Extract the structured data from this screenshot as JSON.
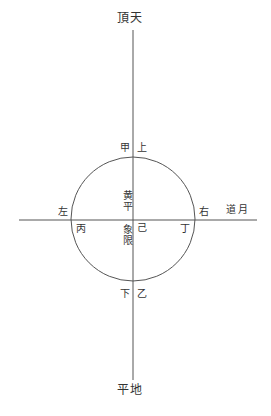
{
  "diagram": {
    "title_top": "頂天",
    "title_bottom": "平地",
    "label_left": "左",
    "label_right": "右",
    "label_ecliptic": "道月",
    "label_jia": "甲",
    "label_shang": "上",
    "label_xia": "下",
    "label_yi": "乙",
    "label_bing": "丙",
    "label_ding": "丁",
    "label_ji": "己",
    "label_center_upper": "黄平",
    "label_center_lower": "象限",
    "colors": {
      "line": "#555555",
      "text": "#333333",
      "background": "#ffffff"
    }
  }
}
